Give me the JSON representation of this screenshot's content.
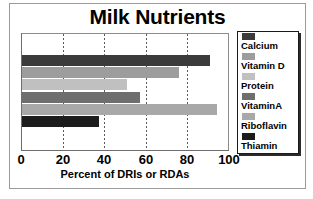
{
  "figure": {
    "title": "Milk Nutrients",
    "frame_color": "#9a9a9a"
  },
  "chart_data": {
    "type": "bar",
    "orientation": "horizontal",
    "title": "Milk Nutrients",
    "xlabel": "Percent of DRIs or RDAs",
    "ylabel": "",
    "xlim": [
      0,
      100
    ],
    "xticks": [
      0,
      20,
      40,
      60,
      80,
      100
    ],
    "xtick_labels": [
      "0",
      "20",
      "40",
      "60",
      "80",
      "100"
    ],
    "grid": "vertical-dashed",
    "legend_position": "right",
    "categories": [
      "Calcium",
      "Vitamin D",
      "Protein",
      "VitaminA",
      "Riboflavin",
      "Thiamin"
    ],
    "values": [
      91,
      76,
      51,
      57,
      94,
      37.5
    ],
    "colors": [
      "#3b3b3b",
      "#9d9d9d",
      "#c0c0c0",
      "#6e6e6e",
      "#a8a8a8",
      "#1c1c1c"
    ],
    "series": [
      {
        "name": "Percent of DRIs or RDAs",
        "values": [
          91,
          76,
          51,
          57,
          94,
          37.5
        ]
      }
    ],
    "bars": [
      {
        "label": "Calcium",
        "value": 91,
        "color": "#3b3b3b"
      },
      {
        "label": "Vitamin D",
        "value": 76,
        "color": "#9d9d9d"
      },
      {
        "label": "Protein",
        "value": 51,
        "color": "#c0c0c0"
      },
      {
        "label": "VitaminA",
        "value": 57,
        "color": "#6e6e6e"
      },
      {
        "label": "Riboflavin",
        "value": 94,
        "color": "#a8a8a8"
      },
      {
        "label": "Thiamin",
        "value": 37.5,
        "color": "#1c1c1c"
      }
    ]
  },
  "legend": {
    "items": [
      {
        "label": "Calcium",
        "color": "#3b3b3b"
      },
      {
        "label": "Vitamin D",
        "color": "#9d9d9d"
      },
      {
        "label": "Protein",
        "color": "#c0c0c0"
      },
      {
        "label": "VitaminA",
        "color": "#6e6e6e"
      },
      {
        "label": "Riboflavin",
        "color": "#a8a8a8"
      },
      {
        "label": "Thiamin",
        "color": "#1c1c1c"
      }
    ]
  }
}
